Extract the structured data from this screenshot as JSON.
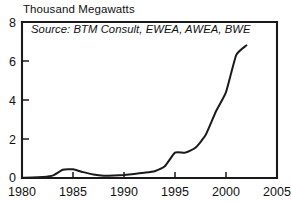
{
  "chart_data": {
    "type": "line",
    "title": "Thousand Megawatts",
    "xlabel": "",
    "ylabel": "Thousand Megawatts",
    "annotations": [
      "Source: BTM Consult, EWEA, AWEA, BWE"
    ],
    "source_note": "Source: BTM Consult, EWEA, AWEA, BWE",
    "grid": false,
    "legend": "none",
    "xlim": [
      1980,
      2005
    ],
    "ylim": [
      0,
      8
    ],
    "xticks": [
      1980,
      1985,
      1990,
      1995,
      2000,
      2005
    ],
    "xtick_labels": [
      "1980",
      "1985",
      "1990",
      "1995",
      "2000",
      "2005"
    ],
    "yticks": [
      0,
      2,
      4,
      6,
      8
    ],
    "ytick_labels": [
      "0",
      "2",
      "4",
      "6",
      "8"
    ],
    "x": [
      1980,
      1981,
      1982,
      1983,
      1984,
      1985,
      1986,
      1987,
      1988,
      1989,
      1990,
      1991,
      1992,
      1993,
      1994,
      1995,
      1996,
      1997,
      1998,
      1999,
      2000,
      2001,
      2002
    ],
    "series": [
      {
        "name": "World Wind Electric Generating Capacity",
        "color": "#1a1a1a",
        "values": [
          0.01,
          0.02,
          0.05,
          0.12,
          0.42,
          0.45,
          0.3,
          0.18,
          0.12,
          0.13,
          0.16,
          0.21,
          0.27,
          0.35,
          0.6,
          1.3,
          1.3,
          1.55,
          2.2,
          3.4,
          4.4,
          6.3,
          6.8
        ]
      }
    ]
  },
  "axes": {
    "y_labels": [
      "8",
      "6",
      "4",
      "2",
      "0"
    ],
    "x_labels": [
      "1980",
      "1985",
      "1990",
      "1995",
      "2000",
      "2005"
    ]
  },
  "colors": {
    "line": "#1a1a1a",
    "frame": "#1a1a1a",
    "background": "#ffffff"
  }
}
